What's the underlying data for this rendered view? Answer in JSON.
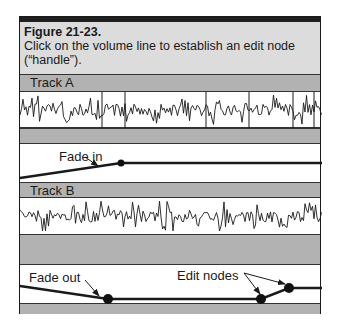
{
  "figure": {
    "title": "Figure 21-23.",
    "caption": "Click on the volume line to establish an edit node (“handle”).",
    "colors": {
      "header_bg": "#dcdcdc",
      "track_bar_bg": "#b2b2b2",
      "line": "#1a1a1a",
      "lane_bg": "#ffffff"
    }
  },
  "tracks": [
    {
      "name": "Track A",
      "waveform_markers_x": [
        82,
        105,
        186,
        229,
        273,
        294
      ],
      "volume_lane": {
        "label": "Fade in",
        "line_points": [
          [
            0,
            161
          ],
          [
            101,
            146
          ],
          [
            302,
            146
          ]
        ],
        "nodes": [
          [
            101,
            146
          ]
        ]
      }
    },
    {
      "name": "Track B",
      "volume_lane": {
        "labels": [
          "Fade out",
          "Edit nodes"
        ],
        "line_points": [
          [
            0,
            269
          ],
          [
            88,
            282
          ],
          [
            241,
            282
          ],
          [
            269,
            271
          ],
          [
            302,
            271
          ]
        ],
        "nodes": [
          [
            88,
            282
          ],
          [
            241,
            282
          ],
          [
            269,
            271
          ]
        ]
      }
    }
  ]
}
